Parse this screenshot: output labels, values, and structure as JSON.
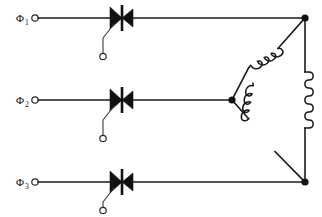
{
  "diagram": {
    "background_color": "#ffffff",
    "line_color": "#1a1a1a",
    "width": 322,
    "height": 217
  },
  "phases": [
    {
      "id": "phase-1",
      "label": "Φ",
      "subscript": "1",
      "input_terminal_label": "",
      "line_y": 18,
      "device": "thyristor",
      "gate_terminal_label": ""
    },
    {
      "id": "phase-2",
      "label": "Φ",
      "subscript": "2",
      "input_terminal_label": "",
      "line_y": 100,
      "device": "thyristor",
      "gate_terminal_label": ""
    },
    {
      "id": "phase-3",
      "label": "Φ",
      "subscript": "3",
      "input_terminal_label": "",
      "line_y": 182,
      "device": "thyristor",
      "gate_terminal_label": ""
    }
  ],
  "load": {
    "connection": "delta",
    "winding_count": 3,
    "windings": [
      {
        "id": "winding-top",
        "name": "upper-diagonal-coil"
      },
      {
        "id": "winding-right",
        "name": "right-vertical-coil"
      },
      {
        "id": "winding-bottom",
        "name": "lower-diagonal-coil"
      }
    ],
    "nodes": [
      {
        "id": "node-top-right",
        "x": 305,
        "y": 18
      },
      {
        "id": "node-middle-left",
        "x": 232,
        "y": 100
      },
      {
        "id": "node-bottom-right",
        "x": 305,
        "y": 182
      }
    ]
  }
}
